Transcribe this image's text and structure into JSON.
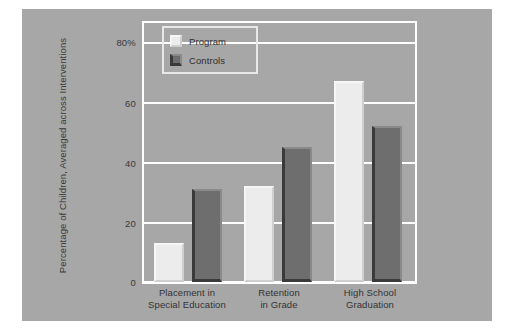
{
  "chart_data": {
    "type": "bar",
    "title": "",
    "xlabel": "",
    "ylabel": "Percentage of Children, Averaged across Interventions",
    "categories": [
      "Placement in\nSpecial Education",
      "Retention\nin Grade",
      "High School\nGraduation"
    ],
    "category_lines": [
      [
        "Placement in",
        "Special Education"
      ],
      [
        "Retention",
        "in Grade"
      ],
      [
        "High School",
        "Graduation"
      ]
    ],
    "series": [
      {
        "name": "Program",
        "values": [
          13,
          32,
          67
        ],
        "color": "#ececec"
      },
      {
        "name": "Controls",
        "values": [
          31,
          45,
          52
        ],
        "color": "#6e6e6e"
      }
    ],
    "ylim": [
      0,
      85
    ],
    "yticks": [
      0,
      20,
      40,
      60,
      80
    ],
    "ytick_labels": [
      "0",
      "20",
      "40",
      "60",
      "80%"
    ],
    "grid": true,
    "grid_color": "#ffffff",
    "legend_position": "top-left",
    "background_color": "#a7a7a7",
    "figure_background": "#ffffff"
  },
  "legend": {
    "items": [
      {
        "label": "Program",
        "swatch": "program-swatch"
      },
      {
        "label": "Controls",
        "swatch": "controls-swatch"
      }
    ]
  },
  "axes": {
    "y_title": "Percentage of Children, Averaged across Interventions",
    "y_tick_labels": [
      "80%",
      "60",
      "40",
      "20",
      "0"
    ]
  }
}
